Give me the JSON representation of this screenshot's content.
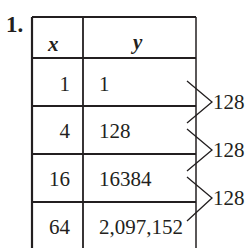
{
  "problem": {
    "number": "1.",
    "headers": {
      "x": "x",
      "y": "y"
    },
    "rows": [
      {
        "x": "1",
        "y": "1"
      },
      {
        "x": "4",
        "y": "128"
      },
      {
        "x": "16",
        "y": "16384"
      },
      {
        "x": "64",
        "y": "2,097,152"
      }
    ],
    "differences": [
      {
        "label": "128"
      },
      {
        "label": "128"
      },
      {
        "label": "128"
      }
    ]
  },
  "colors": {
    "ink": "#231f20",
    "background": "#ffffff"
  }
}
